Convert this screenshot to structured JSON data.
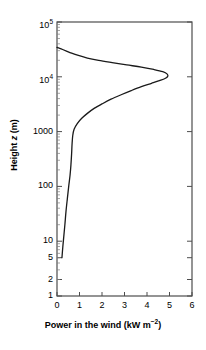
{
  "chart_data": {
    "type": "line",
    "title": "",
    "xlabel": "Power in the wind (kW m",
    "xlabel_sup": "−2",
    "xlabel_tail": ")",
    "xlabel_full": "Power in the wind (kW m−2)",
    "ylabel_pre": "Height ",
    "ylabel_var": "z",
    "ylabel_post": " (m)",
    "ylabel_full": "Height z (m)",
    "xscale": "linear",
    "yscale": "log",
    "xlim": [
      0,
      6
    ],
    "ylim": [
      1,
      100000
    ],
    "grid": false,
    "legend": null,
    "xticks": [
      "0",
      "1",
      "2",
      "3",
      "4",
      "5",
      "6"
    ],
    "xtick_values": [
      0,
      1,
      2,
      3,
      4,
      5,
      6
    ],
    "yticks": [
      {
        "label": "1",
        "sup": "",
        "value": 1
      },
      {
        "label": "2",
        "sup": "",
        "value": 2
      },
      {
        "label": "5",
        "sup": "",
        "value": 5
      },
      {
        "label": "10",
        "sup": "",
        "value": 10
      },
      {
        "label": "100",
        "sup": "",
        "value": 100
      },
      {
        "label": "1000",
        "sup": "",
        "value": 1000
      },
      {
        "label": "10",
        "sup": "4",
        "value": 10000
      },
      {
        "label": "10",
        "sup": "5",
        "value": 100000
      }
    ],
    "series": [
      {
        "name": "Power in the wind",
        "points": [
          [
            0.22,
            5
          ],
          [
            0.26,
            8
          ],
          [
            0.3,
            12
          ],
          [
            0.35,
            20
          ],
          [
            0.4,
            35
          ],
          [
            0.46,
            60
          ],
          [
            0.52,
            100
          ],
          [
            0.58,
            160
          ],
          [
            0.62,
            250
          ],
          [
            0.65,
            400
          ],
          [
            0.67,
            600
          ],
          [
            0.7,
            850
          ],
          [
            0.76,
            1100
          ],
          [
            0.9,
            1400
          ],
          [
            1.1,
            1750
          ],
          [
            1.35,
            2150
          ],
          [
            1.65,
            2650
          ],
          [
            2.0,
            3200
          ],
          [
            2.4,
            3900
          ],
          [
            2.85,
            4700
          ],
          [
            3.3,
            5600
          ],
          [
            3.75,
            6600
          ],
          [
            4.2,
            7600
          ],
          [
            4.55,
            8500
          ],
          [
            4.8,
            9300
          ],
          [
            4.92,
            10200
          ],
          [
            4.9,
            11200
          ],
          [
            4.7,
            12400
          ],
          [
            4.3,
            13600
          ],
          [
            3.75,
            15000
          ],
          [
            3.1,
            16500
          ],
          [
            2.45,
            18200
          ],
          [
            1.85,
            20000
          ],
          [
            1.35,
            22000
          ],
          [
            0.95,
            24500
          ],
          [
            0.65,
            27000
          ],
          [
            0.42,
            29500
          ],
          [
            0.25,
            31500
          ],
          [
            0.12,
            33000
          ],
          [
            0.03,
            34000
          ],
          [
            0.0,
            34500
          ]
        ]
      }
    ]
  }
}
